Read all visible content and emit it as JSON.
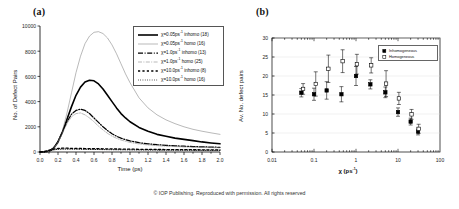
{
  "footer": {
    "copyright": "© IOP Publishing.  Reproduced with permission.  All rights reserved"
  },
  "panel_a": {
    "label": "(a)",
    "legend_title": "",
    "legend": [
      {
        "text": "χ=0.05ps",
        "sup": "-1",
        "suffix": " inhomo (18)",
        "key": "solid-thick"
      },
      {
        "text": "χ=0.05ps",
        "sup": "-1",
        "suffix": " homo (16)",
        "key": "solid-thin"
      },
      {
        "text": "χ=1.0ps",
        "sup": "-1",
        "suffix": " inhomo (13)",
        "key": "dashdot-thick"
      },
      {
        "text": "χ=1.0ps",
        "sup": "-1",
        "suffix": " homo (25)",
        "key": "dashdot-thin"
      },
      {
        "text": "χ=10.0ps",
        "sup": "-1",
        "suffix": " inhomo (8)",
        "key": "dashed-thick"
      },
      {
        "text": "χ=10.0ps",
        "sup": "-1",
        "suffix": " homo (16)",
        "key": "dotted-thin"
      }
    ]
  },
  "panel_b": {
    "label": "(b)",
    "legend": [
      {
        "text": "Inhomogeneous",
        "marker": "filled-square"
      },
      {
        "text": "Homogeneous",
        "marker": "open-square"
      }
    ]
  },
  "chart_data": [
    {
      "type": "line",
      "id": "panel-a",
      "title": "(a)",
      "xlabel": "Time (ps)",
      "ylabel": "No. of Defect Pairs",
      "xlim": [
        0.0,
        2.0
      ],
      "ylim": [
        0,
        10000
      ],
      "xticks": [
        "0.0",
        "0.2",
        "0.4",
        "0.6",
        "0.8",
        "1.0",
        "1.2",
        "1.4",
        "1.6",
        "1.8",
        "2.0"
      ],
      "yticks": [
        "0",
        "2000",
        "4000",
        "6000",
        "8000",
        "10000"
      ],
      "grid": false,
      "legend_position": "upper-right",
      "x": [
        0.0,
        0.05,
        0.1,
        0.15,
        0.2,
        0.25,
        0.3,
        0.35,
        0.4,
        0.45,
        0.5,
        0.55,
        0.6,
        0.65,
        0.7,
        0.75,
        0.8,
        0.85,
        0.9,
        0.95,
        1.0,
        1.1,
        1.2,
        1.3,
        1.4,
        1.5,
        1.6,
        1.7,
        1.8,
        1.9,
        2.0
      ],
      "series": [
        {
          "name": "χ=0.05ps-1 inhomo (18)",
          "style": "solid-thick",
          "values": [
            0,
            0,
            60,
            300,
            800,
            1600,
            2600,
            3600,
            4500,
            5150,
            5550,
            5700,
            5650,
            5400,
            5000,
            4500,
            4000,
            3500,
            3050,
            2700,
            2400,
            1950,
            1650,
            1400,
            1250,
            1100,
            1000,
            900,
            800,
            720,
            650
          ]
        },
        {
          "name": "χ=0.05ps-1 homo (16)",
          "style": "solid-thin",
          "values": [
            0,
            0,
            30,
            200,
            700,
            1700,
            3100,
            4700,
            6300,
            7600,
            8600,
            9200,
            9500,
            9550,
            9400,
            9050,
            8500,
            7800,
            7000,
            6200,
            5500,
            4300,
            3500,
            2950,
            2550,
            2250,
            2000,
            1800,
            1650,
            1520,
            1400
          ]
        },
        {
          "name": "χ=1.0ps-1 inhomo (13)",
          "style": "dashdot-thick",
          "values": [
            0,
            0,
            60,
            300,
            820,
            1600,
            2400,
            3000,
            3300,
            3400,
            3300,
            3050,
            2700,
            2350,
            2000,
            1700,
            1450,
            1250,
            1100,
            980,
            880,
            740,
            650,
            580,
            530,
            490,
            460,
            430,
            410,
            390,
            370
          ]
        },
        {
          "name": "χ=1.0ps-1 homo (25)",
          "style": "dashdot-thin",
          "values": [
            0,
            0,
            55,
            280,
            780,
            1500,
            2250,
            2800,
            3050,
            3100,
            2950,
            2700,
            2400,
            2050,
            1750,
            1480,
            1260,
            1090,
            950,
            850,
            760,
            640,
            560,
            500,
            460,
            430,
            400,
            380,
            360,
            345,
            330
          ]
        },
        {
          "name": "χ=10.0ps-1 inhomo (8)",
          "style": "dashed-thick",
          "values": [
            0,
            40,
            140,
            230,
            280,
            300,
            300,
            290,
            285,
            280,
            275,
            270,
            265,
            260,
            255,
            250,
            245,
            240,
            235,
            230,
            225,
            215,
            205,
            200,
            195,
            190,
            185,
            180,
            175,
            170,
            165
          ]
        },
        {
          "name": "χ=10.0ps-1 homo (16)",
          "style": "dotted-thin",
          "values": [
            0,
            30,
            100,
            170,
            210,
            225,
            228,
            225,
            220,
            215,
            210,
            205,
            200,
            196,
            192,
            188,
            184,
            180,
            177,
            174,
            170,
            164,
            158,
            153,
            149,
            145,
            141,
            138,
            135,
            132,
            130
          ]
        }
      ]
    },
    {
      "type": "scatter",
      "id": "panel-b",
      "title": "(b)",
      "xlabel": "χ (ps-1)",
      "ylabel": "Av. No. defect pairs",
      "xscale": "log",
      "xlim": [
        0.01,
        100
      ],
      "ylim": [
        0,
        30
      ],
      "xticks": [
        "0.01",
        "0.1",
        "1",
        "10",
        "100"
      ],
      "yticks": [
        "0",
        "5",
        "10",
        "15",
        "20",
        "25",
        "30"
      ],
      "grid": true,
      "legend_position": "upper-right",
      "series": [
        {
          "name": "Inhomogeneous",
          "marker": "filled-square",
          "points": [
            {
              "x": 0.05,
              "y": 15.6,
              "err": 1.1
            },
            {
              "x": 0.1,
              "y": 15.2,
              "err": 1.6
            },
            {
              "x": 0.2,
              "y": 16.2,
              "err": 2.3
            },
            {
              "x": 0.45,
              "y": 15.2,
              "err": 2.0
            },
            {
              "x": 1.0,
              "y": 20.0,
              "err": 2.5
            },
            {
              "x": 2.2,
              "y": 17.8,
              "err": 1.2
            },
            {
              "x": 5.0,
              "y": 15.7,
              "err": 1.4
            },
            {
              "x": 10.0,
              "y": 10.5,
              "err": 1.1
            },
            {
              "x": 20.0,
              "y": 8.0,
              "err": 0.9
            },
            {
              "x": 30.0,
              "y": 5.4,
              "err": 0.9
            }
          ]
        },
        {
          "name": "Homogeneous",
          "marker": "open-square",
          "points": [
            {
              "x": 0.055,
              "y": 16.6,
              "err": 1.4
            },
            {
              "x": 0.11,
              "y": 17.9,
              "err": 3.2
            },
            {
              "x": 0.22,
              "y": 21.9,
              "err": 3.6
            },
            {
              "x": 0.48,
              "y": 23.9,
              "err": 3.0
            },
            {
              "x": 1.05,
              "y": 23.1,
              "err": 2.6
            },
            {
              "x": 2.3,
              "y": 22.8,
              "err": 2.0
            },
            {
              "x": 5.2,
              "y": 18.0,
              "err": 3.4
            },
            {
              "x": 10.5,
              "y": 14.1,
              "err": 1.6
            },
            {
              "x": 21.0,
              "y": 9.9,
              "err": 1.3
            },
            {
              "x": 31.0,
              "y": 6.1,
              "err": 1.2
            }
          ]
        }
      ]
    }
  ]
}
